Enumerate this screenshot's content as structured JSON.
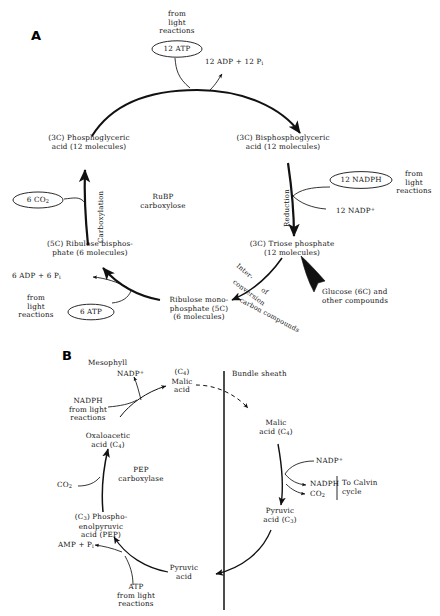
{
  "figure": {
    "panels": [
      {
        "id": "A",
        "label": "A",
        "title": "Calvin cycle (C3 photosynthetic carbon reduction cycle)"
      },
      {
        "id": "B",
        "label": "B",
        "title": "C4 dicarboxylic acid (Hatch-Slack) pathway"
      }
    ],
    "background": "#ffffff",
    "ink": "#111111"
  },
  "panelA": {
    "label": "A",
    "source_top": "from\nlight\nreactions",
    "atp_top": "12 ATP",
    "adp_top": "12 ADP + 12 P",
    "adp_top_sub": "i",
    "pga": "(3C) Phosphoglyceric\nacid (12 molecules)",
    "bpga": "(3C) Bisphosphoglyceric\nacid (12 molecules)",
    "carboxylation_label": "Carboxylation",
    "reduction_label": "Reduction",
    "enzyme": "RuBP\ncarboxylose",
    "co2": "6 CO",
    "co2_sub": "2",
    "nadph": "12 NADPH",
    "nadp_plus": "12 NADP",
    "nadp_plus_sup": "+",
    "source_right": "from\nlight\nreactions",
    "rubp": "(5C) Ribulose bisphos-\nphate (6 molecules)",
    "triose": "(3C) Triose phosphate\n(12 molecules)",
    "adp_bottom": "6 ADP + 6 P",
    "adp_bottom_sub": "i",
    "source_bottom": "from\nlight\nreactions",
    "atp_bottom": "6 ATP",
    "rump": "Ribulose mono-\nphosphate (5C)\n(6 molecules)",
    "interconversion": [
      "Inter-",
      "conversion",
      "of",
      "carbon compounds"
    ],
    "glucose": "Glucose (6C) and\nother compounds"
  },
  "panelB": {
    "label": "B",
    "mesophyll": "Mesophyll",
    "bundle_sheath": "Bundle sheath",
    "nadp_plus_top": "NADP",
    "nadp_plus_top_sup": "+",
    "nadph_light": "NADPH\nfrom light\nreactions",
    "malic_meso": "(C",
    "malic_meso_sub": "4",
    "malic_meso_rest": ")\nMalic\nacid",
    "oaa": "Oxaloacetic\nacid (C",
    "oaa_sub": "4",
    "oaa_rest": ")",
    "pep_enzyme": "PEP\ncarboxylase",
    "co2_left": "CO",
    "co2_left_sub": "2",
    "pep": "(C",
    "pep_sub": "3",
    "pep_rest": ") Phospho-\nenolpyruvic\nacid (PEP)",
    "amp": "AMP + P",
    "amp_sub": "i",
    "atp_light": "ATP\nfrom light\nreactions",
    "pyruvic_bottom": "Pyruvic\nacid",
    "malic_bundle": "Malic\nacid (C",
    "malic_bundle_sub": "4",
    "malic_bundle_rest": ")",
    "nadp_plus_right": "NADP",
    "nadp_plus_right_sup": "+",
    "nadph_right": "NADPH",
    "co2_right": "CO",
    "co2_right_sub": "2",
    "to_calvin": "To Calvin\ncycle",
    "pyruvic_bundle": "Pyruvic\nacid (C",
    "pyruvic_bundle_sub": "3",
    "pyruvic_bundle_rest": ")"
  }
}
